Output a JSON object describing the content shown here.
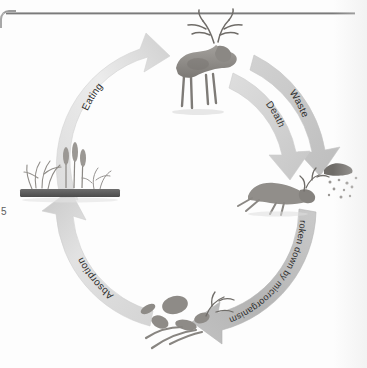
{
  "figure": {
    "type": "cycle-diagram",
    "background_color": "#fdfdfd",
    "palette": {
      "band_light": "#e9e9e9",
      "band_mid": "#c9c9c9",
      "band_dark": "#b0b0b0",
      "illustration_grey": "#8f8f8f",
      "soil_bar": "#5d5d5d",
      "label_text": "#2f2f2f"
    },
    "cycle_direction": "clockwise",
    "arrows": [
      {
        "id": "eating",
        "label": "Eating",
        "from": "plants",
        "to": "live-deer",
        "position": "upper-left",
        "points": "up-right",
        "tone": "#e4e4e4"
      },
      {
        "id": "waste",
        "label": "Waste",
        "from": "live-deer",
        "to": "waste-pile",
        "position": "upper-right",
        "points": "down",
        "tone": "#cfcfcf"
      },
      {
        "id": "death",
        "label": "Death",
        "from": "live-deer",
        "to": "dead-deer",
        "position": "upper-right",
        "points": "down",
        "tone": "#d6d6d6"
      },
      {
        "id": "breakdown",
        "label": "Broken down by microorganisms",
        "from": "dead-deer",
        "to": "decomposers",
        "position": "lower-right",
        "points": "left",
        "tone": "#bdbdbd"
      },
      {
        "id": "absorption",
        "label": "Absorption",
        "from": "decomposers",
        "to": "plants",
        "position": "lower-left",
        "points": "up",
        "tone": "#d9d9d9"
      }
    ],
    "nodes": [
      {
        "id": "live-deer",
        "name": "living stag",
        "position": "top"
      },
      {
        "id": "dead-deer",
        "name": "dead deer carcass",
        "position": "right"
      },
      {
        "id": "waste-pile",
        "name": "animal droppings and particles",
        "position": "right-upper"
      },
      {
        "id": "decomposers",
        "name": "bones and decomposing remains",
        "position": "bottom"
      },
      {
        "id": "plants",
        "name": "plants and grasses rooted in soil",
        "position": "left"
      }
    ]
  },
  "page": {
    "scan_edge_mark": "5"
  }
}
